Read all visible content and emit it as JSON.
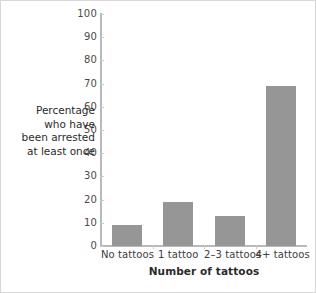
{
  "chart_data": {
    "type": "bar",
    "title": "",
    "subtitle": "",
    "categories": [
      "No tattoos",
      "1 tattoo",
      "2–3 tattoos",
      "4+ tattoos"
    ],
    "values": [
      9,
      19,
      13,
      69
    ],
    "xlabel": "Number of tattoos",
    "ylabel": "Percentage who have been arrested at least once",
    "ylabel_lines": [
      "Percentage",
      "who have",
      "been arrested",
      "at least once"
    ],
    "ylim": [
      0,
      100
    ],
    "ytick_step": 10,
    "yticks": [
      0,
      10,
      20,
      30,
      40,
      50,
      60,
      70,
      80,
      90,
      100
    ],
    "ytick_labels": [
      "0",
      "10",
      "20",
      "30",
      "40",
      "50",
      "60",
      "70",
      "80",
      "90",
      "100"
    ],
    "grid": false,
    "legend": null,
    "legend_position": "none",
    "series": [
      {
        "name": "Percentage arrested at least once",
        "values": [
          9,
          19,
          13,
          69
        ]
      }
    ],
    "annotations": []
  },
  "style": {
    "bar_color": "#969696",
    "axis_color": "#b9b9b9",
    "tick_label_color": "#4a4a4a",
    "axis_title_color": "#2b2b2b",
    "background": "#ffffff",
    "border_color": "#d8d8d8"
  }
}
